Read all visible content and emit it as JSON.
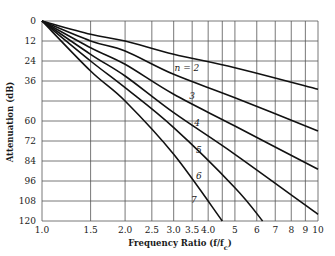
{
  "chart_data": {
    "type": "line",
    "title": "",
    "xlabel": "Frequency Ratio (f/f_c)",
    "ylabel": "Attenuation (dB)",
    "xscale": "log",
    "xlim": [
      1.0,
      10
    ],
    "ylim": [
      0,
      120
    ],
    "y_inverted": true,
    "grid": true,
    "x_ticks": [
      1.0,
      1.5,
      2.0,
      2.5,
      3.0,
      3.5,
      4.0,
      5,
      6,
      7,
      8,
      9,
      10
    ],
    "x_tick_labels": [
      "1.0",
      "1.5",
      "2.0",
      "2.5",
      "3.0",
      "3.5",
      "4.0",
      "5",
      "6",
      "7",
      "8",
      "9",
      "10"
    ],
    "x_gridlines": [
      1.0,
      1.5,
      2.0,
      2.5,
      3.0,
      3.5,
      4.0,
      4.5,
      5,
      6,
      7,
      8,
      9,
      10
    ],
    "y_ticks": [
      0,
      12,
      24,
      36,
      60,
      72,
      84,
      96,
      108,
      120
    ],
    "y_tick_labels": [
      "0",
      "12",
      "24",
      "36",
      "60",
      "72",
      "84",
      "96",
      "108",
      "120"
    ],
    "y_gridlines": [
      0,
      12,
      24,
      36,
      48,
      60,
      72,
      84,
      96,
      108,
      120
    ],
    "series": [
      {
        "name": "n = 2",
        "label": "n = 2",
        "x": [
          1.0,
          1.5,
          2.0,
          3.0,
          5.0,
          10.0
        ],
        "y": [
          0,
          8,
          12,
          20,
          28,
          41
        ]
      },
      {
        "name": "n = 3",
        "label": "3",
        "x": [
          1.0,
          1.5,
          2.0,
          3.0,
          5.0,
          10.0
        ],
        "y": [
          0,
          12,
          18,
          32,
          46,
          66
        ]
      },
      {
        "name": "n = 4",
        "label": "4",
        "x": [
          1.0,
          1.5,
          2.0,
          3.0,
          5.0,
          10.0
        ],
        "y": [
          0,
          16,
          26,
          44,
          63,
          89
        ]
      },
      {
        "name": "n = 5",
        "label": "5",
        "x": [
          1.0,
          1.5,
          2.0,
          3.0,
          5.0,
          10.0
        ],
        "y": [
          0,
          20,
          33,
          55,
          80,
          116
        ]
      },
      {
        "name": "n = 6",
        "label": "6",
        "x": [
          1.0,
          1.5,
          2.0,
          3.0,
          5.0,
          6.3
        ],
        "y": [
          0,
          24,
          40,
          64,
          100,
          120
        ]
      },
      {
        "name": "n = 7",
        "label": "7",
        "x": [
          1.0,
          1.5,
          2.0,
          3.0,
          4.5
        ],
        "y": [
          0,
          30,
          48,
          80,
          120
        ]
      }
    ],
    "curve_labels": [
      {
        "text": "n = 2",
        "x": 3.35,
        "y": 30
      },
      {
        "text": "3",
        "x": 3.5,
        "y": 47
      },
      {
        "text": "4",
        "x": 3.65,
        "y": 63
      },
      {
        "text": "5",
        "x": 3.7,
        "y": 79
      },
      {
        "text": "6",
        "x": 3.7,
        "y": 95
      },
      {
        "text": "7",
        "x": 3.55,
        "y": 109
      }
    ],
    "legend": null
  },
  "colors": {
    "line": "#111111",
    "grid": "#555555",
    "background": "#ffffff"
  }
}
